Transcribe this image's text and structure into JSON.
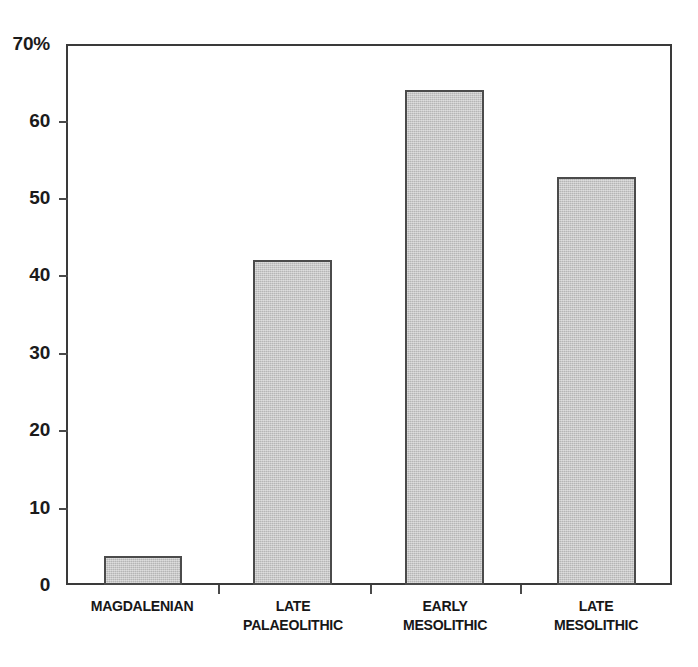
{
  "chart_data": {
    "type": "bar",
    "title": "",
    "subtitle": "",
    "xlabel": "",
    "ylabel": "",
    "categories": [
      "MAGDALENIAN",
      "LATE\nPALAEOLITHIC",
      "EARLY\nMESOLITHIC",
      "LATE\nMESOLITHIC"
    ],
    "values": [
      3.8,
      42,
      64,
      52.8
    ],
    "ylim": [
      0,
      70
    ],
    "ytick_values": [
      0,
      10,
      20,
      30,
      40,
      50,
      60,
      70
    ],
    "ytick_labels": [
      "0",
      "10",
      "20",
      "30",
      "40",
      "50",
      "60",
      "70%"
    ],
    "unit": "%",
    "grid": false,
    "legend": null,
    "legend_position": "none",
    "series": [
      {
        "name": "percentage",
        "values": [
          3.8,
          42,
          64,
          52.8
        ]
      }
    ]
  },
  "style": {
    "bar_fill": "#c2c2c2",
    "bar_border": "#4b4b4b",
    "axis_color": "#3a3a3a",
    "text_color": "#171717",
    "background": "#ffffff"
  }
}
